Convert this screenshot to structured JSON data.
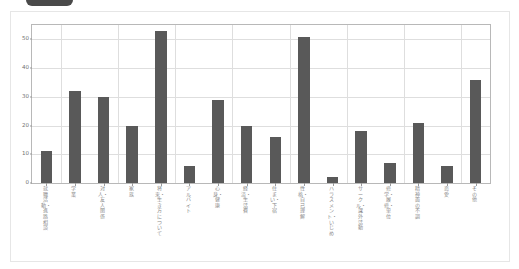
{
  "top_control": {
    "label": ""
  },
  "chart_data": {
    "type": "bar",
    "title": "",
    "subtitle": "",
    "xlabel": "",
    "ylabel": "",
    "ylim": [
      0,
      55
    ],
    "yticks": [
      0,
      10,
      20,
      30,
      40,
      50
    ],
    "ytick_labels": [
      "0",
      "10",
      "20",
      "30",
      "40",
      "50"
    ],
    "grid": true,
    "legend": "none",
    "bar_color": "#595959",
    "grid_color": "#dedede",
    "axis_color": "#b8b8b8",
    "categories": [
      "就職活動・進路相談",
      "学業",
      "対人・友人関係",
      "家族",
      "将来・生き方について",
      "アルバイト",
      "心身・健康",
      "経済・生活費",
      "住まい・下宿",
      "性格・自己理解",
      "ハラスメント・いじめ",
      "サークル・課外活動",
      "修学・履修・単位",
      "精神面の不調",
      "恋愛",
      "その他"
    ],
    "values": [
      11,
      32,
      30,
      20,
      53,
      6,
      29,
      20,
      16,
      51,
      2,
      18,
      7,
      21,
      6,
      36
    ]
  }
}
